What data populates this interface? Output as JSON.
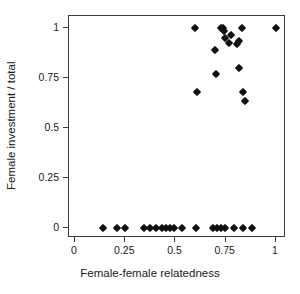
{
  "chart_data": {
    "type": "scatter",
    "title": "",
    "xlabel": "Female-female relatedness",
    "ylabel": "Female investment / total",
    "xlim": [
      -0.03,
      1.05
    ],
    "ylim": [
      -0.05,
      1.06
    ],
    "xticks": [
      0,
      0.25,
      0.5,
      0.75,
      1
    ],
    "xticklabels": [
      "0",
      "0.25",
      "0.5",
      "0.75",
      "1"
    ],
    "yticks": [
      0,
      0.25,
      0.5,
      0.75,
      1
    ],
    "yticklabels": [
      "0",
      "0.25",
      "0.5",
      "0.75",
      "1"
    ],
    "grid": false,
    "legend": null,
    "marker": "diamond",
    "marker_color": "#111111",
    "box_color": "#3c3c3c",
    "background": "#ffffff",
    "points": [
      {
        "x": 0.14,
        "y": 0
      },
      {
        "x": 0.21,
        "y": 0
      },
      {
        "x": 0.25,
        "y": 0
      },
      {
        "x": 0.345,
        "y": 0
      },
      {
        "x": 0.375,
        "y": 0
      },
      {
        "x": 0.405,
        "y": 0
      },
      {
        "x": 0.435,
        "y": 0
      },
      {
        "x": 0.455,
        "y": 0
      },
      {
        "x": 0.475,
        "y": 0
      },
      {
        "x": 0.495,
        "y": 0
      },
      {
        "x": 0.53,
        "y": 0
      },
      {
        "x": 0.6,
        "y": 0
      },
      {
        "x": 0.685,
        "y": 0
      },
      {
        "x": 0.705,
        "y": 0
      },
      {
        "x": 0.725,
        "y": 0
      },
      {
        "x": 0.745,
        "y": 0
      },
      {
        "x": 0.79,
        "y": 0
      },
      {
        "x": 0.835,
        "y": 0
      },
      {
        "x": 0.88,
        "y": 0
      },
      {
        "x": 0.605,
        "y": 0.68
      },
      {
        "x": 0.7,
        "y": 0.77
      },
      {
        "x": 0.695,
        "y": 0.89
      },
      {
        "x": 0.595,
        "y": 1.0
      },
      {
        "x": 0.725,
        "y": 1.0
      },
      {
        "x": 0.735,
        "y": 1.0
      },
      {
        "x": 0.74,
        "y": 0.985
      },
      {
        "x": 0.745,
        "y": 0.95
      },
      {
        "x": 0.775,
        "y": 0.965
      },
      {
        "x": 0.765,
        "y": 0.925
      },
      {
        "x": 0.805,
        "y": 0.92
      },
      {
        "x": 0.815,
        "y": 0.935
      },
      {
        "x": 0.815,
        "y": 0.8
      },
      {
        "x": 0.83,
        "y": 1.0
      },
      {
        "x": 0.835,
        "y": 0.68
      },
      {
        "x": 0.845,
        "y": 0.635
      },
      {
        "x": 1.0,
        "y": 1.0
      }
    ]
  }
}
